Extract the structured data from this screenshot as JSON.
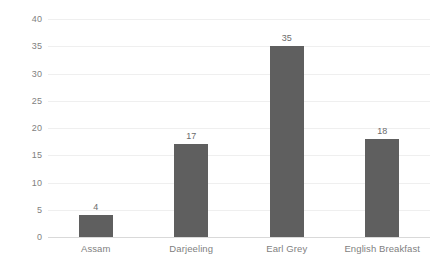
{
  "chart_data": {
    "type": "bar",
    "title": "",
    "subtitle": "",
    "xlabel": "",
    "ylabel": "",
    "categories": [
      "Assam",
      "Darjeeling",
      "Earl Grey",
      "English Breakfast"
    ],
    "values": [
      4,
      17,
      35,
      18
    ],
    "data_labels": [
      "4",
      "17",
      "35",
      "18"
    ],
    "ylim": [
      0,
      40
    ],
    "yticks": [
      0,
      5,
      10,
      15,
      20,
      25,
      30,
      35,
      40
    ],
    "ytick_labels": [
      "0",
      "5",
      "10",
      "15",
      "20",
      "25",
      "30",
      "35",
      "40"
    ],
    "grid": true,
    "grid_axis": "y",
    "legend": false,
    "legend_position": "none",
    "colors": {
      "bar": "#5f5f5f",
      "gridline": "#efefef",
      "axis_line": "#d9d9d9",
      "tick_text": "#7f7f7f",
      "data_label_text": "#6b6b6b",
      "background": "#ffffff"
    }
  }
}
